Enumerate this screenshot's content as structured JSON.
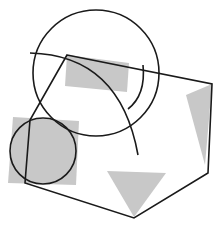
{
  "diagram": {
    "width": 223,
    "height": 227,
    "background": "#ffffff",
    "stroke_color": "#1a1a1a",
    "fill_color": "#c8c8c8",
    "shapes": {
      "rect_top": {
        "points": "67,55 129,63 127,92 65,86"
      },
      "rect_left": {
        "points": "13,117 79,121 76,185 8,183"
      },
      "triangle_right": {
        "points": "186,95 212,84 205,165"
      },
      "triangle_bottom": {
        "points": "107,171 166,173 134,217"
      },
      "polygon": {
        "points": "67,55 212,84 208,173 134,218 25,183 30,120"
      },
      "circle_large": {
        "cx": 96,
        "cy": 73,
        "r": 63
      },
      "circle_small": {
        "cx": 43,
        "cy": 151,
        "r": 33
      },
      "arc_long": {
        "d": "M 30 53 Q 120 55 138 155"
      },
      "arc_short": {
        "d": "M 143 65 Q 146 95 128 109"
      }
    }
  }
}
